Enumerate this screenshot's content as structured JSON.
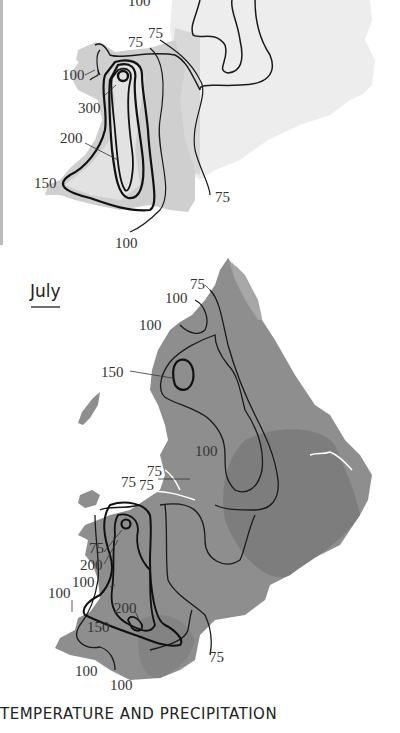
{
  "figure": {
    "caption": "TEMPERATURE AND PRECIPITATION",
    "colors": {
      "background": "#ffffff",
      "land_light": "#e9e9e9",
      "land_light_band": "#d3d3d3",
      "land_july": "#8e8e8e",
      "land_july_dark": "#7c7c7c",
      "land_july_light": "#a8a8a8",
      "isohyet": "#1a1a1a"
    }
  },
  "upper_map": {
    "title": "",
    "labels": {
      "top_100": "100",
      "n_75_a": "75",
      "n_75_b": "75",
      "w_100": "100",
      "w_300": "300",
      "w_200": "200",
      "sw_150": "150",
      "se_75": "75",
      "s_100": "100"
    }
  },
  "lower_map": {
    "title": "July",
    "labels": {
      "n_75": "75",
      "n_100_a": "100",
      "n_100_b": "100",
      "lake_150": "150",
      "pennine_100": "100",
      "mid_75_a": "75",
      "mid_75_b": "75",
      "mid_75_c": "75",
      "w_75": "75",
      "w_200": "200",
      "w_100_a": "100",
      "w_100_b": "100",
      "c_200": "200",
      "c_150": "150",
      "se_75": "75",
      "s_100_a": "100",
      "s_100_b": "100"
    }
  }
}
